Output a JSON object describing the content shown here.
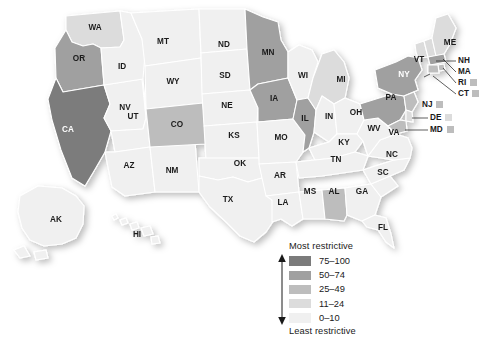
{
  "figure": {
    "type": "choropleth-map",
    "region": "United States",
    "background_color": "#ffffff"
  },
  "legend": {
    "top_caption": "Most restrictive",
    "bottom_caption": "Least restrictive",
    "arrow_icon": "double-headed-vertical-arrow",
    "bins": [
      {
        "label": "75–100",
        "color": "#7b7b7b",
        "min": 75,
        "max": 100
      },
      {
        "label": "50–74",
        "color": "#a0a0a0",
        "min": 50,
        "max": 74
      },
      {
        "label": "25–49",
        "color": "#bdbdbd",
        "min": 25,
        "max": 49
      },
      {
        "label": "11–24",
        "color": "#dcdcdc",
        "min": 11,
        "max": 24
      },
      {
        "label": "0–10",
        "color": "#f0f0f0",
        "min": 0,
        "max": 10
      }
    ]
  },
  "chart_data": {
    "type": "choropleth",
    "title": "",
    "value_label": "Restrictiveness score",
    "categories": [
      "AL",
      "AK",
      "AZ",
      "AR",
      "CA",
      "CO",
      "CT",
      "DE",
      "FL",
      "GA",
      "HI",
      "ID",
      "IL",
      "IN",
      "IA",
      "KS",
      "KY",
      "LA",
      "ME",
      "MD",
      "MA",
      "MI",
      "MN",
      "MS",
      "MO",
      "MT",
      "NE",
      "NV",
      "NH",
      "NJ",
      "NM",
      "NY",
      "NC",
      "ND",
      "OH",
      "OK",
      "OR",
      "PA",
      "RI",
      "SC",
      "SD",
      "TN",
      "TX",
      "UT",
      "VT",
      "VA",
      "WA",
      "WV",
      "WI",
      "WY"
    ],
    "bins_index": {
      "AL": 2,
      "AK": 4,
      "AZ": 4,
      "AR": 4,
      "CA": 0,
      "CO": 2,
      "CT": 2,
      "DE": 3,
      "FL": 4,
      "GA": 4,
      "HI": 4,
      "ID": 4,
      "IL": 1,
      "IN": 4,
      "IA": 1,
      "KS": 4,
      "KY": 4,
      "LA": 4,
      "ME": 3,
      "MD": 2,
      "MA": 1,
      "MI": 3,
      "MN": 1,
      "MS": 4,
      "MO": 4,
      "MT": 4,
      "NE": 4,
      "NV": 4,
      "NH": 3,
      "NJ": 2,
      "NM": 4,
      "NY": 1,
      "NC": 4,
      "ND": 4,
      "OH": 4,
      "OK": 4,
      "OR": 1,
      "PA": 1,
      "RI": 2,
      "SC": 4,
      "SD": 4,
      "TN": 4,
      "TX": 4,
      "UT": 4,
      "VT": 3,
      "VA": 4,
      "WA": 3,
      "WV": 4,
      "WI": 4,
      "WY": 4
    },
    "inset_states": [
      "AK",
      "HI"
    ],
    "callout_states": [
      "NH",
      "MA",
      "RI",
      "CT",
      "NJ",
      "DE",
      "MD"
    ],
    "colorscale": [
      "#f0f0f0",
      "#dcdcdc",
      "#bdbdbd",
      "#a0a0a0",
      "#7b7b7b"
    ],
    "legend_position": "bottom-center",
    "grid": false
  },
  "map_labels": {
    "WA": "WA",
    "OR": "OR",
    "CA": "CA",
    "NV": "NV",
    "ID": "ID",
    "MT": "MT",
    "WY": "WY",
    "UT": "UT",
    "AZ": "AZ",
    "NM": "NM",
    "CO": "CO",
    "ND": "ND",
    "SD": "SD",
    "NE": "NE",
    "KS": "KS",
    "OK": "OK",
    "TX": "TX",
    "MN": "MN",
    "IA": "IA",
    "MO": "MO",
    "AR": "AR",
    "LA": "LA",
    "WI": "WI",
    "IL": "IL",
    "MS": "MS",
    "AL": "AL",
    "MI": "MI",
    "IN": "IN",
    "OH": "OH",
    "KY": "KY",
    "TN": "TN",
    "GA": "GA",
    "FL": "FL",
    "SC": "SC",
    "NC": "NC",
    "VA": "VA",
    "WV": "WV",
    "PA": "PA",
    "NY": "NY",
    "VT": "VT",
    "ME": "ME",
    "NH": "NH",
    "MA": "MA",
    "RI": "RI",
    "CT": "CT",
    "NJ": "NJ",
    "DE": "DE",
    "MD": "MD",
    "AK": "AK",
    "HI": "HI"
  }
}
